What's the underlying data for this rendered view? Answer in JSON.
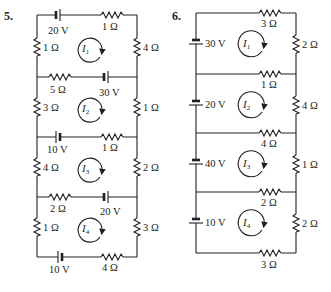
{
  "problems": [
    {
      "number": "5.",
      "loops": [
        {
          "current": "I",
          "sub": "1"
        },
        {
          "current": "I",
          "sub": "2"
        },
        {
          "current": "I",
          "sub": "3"
        },
        {
          "current": "I",
          "sub": "4"
        }
      ],
      "components": {
        "top_battery": "20 V",
        "top_resistor": "1 Ω",
        "loop1_left": "1 Ω",
        "loop1_right": "4 Ω",
        "h1_resistor": "5 Ω",
        "h1_battery": "30 V",
        "loop2_left": "3 Ω",
        "loop2_right": "1 Ω",
        "h2_battery": "10 V",
        "h2_resistor": "1 Ω",
        "loop3_left": "4 Ω",
        "loop3_right": "2 Ω",
        "h3_resistor": "2 Ω",
        "h3_battery": "20 V",
        "loop4_left": "1 Ω",
        "loop4_right": "3 Ω",
        "bottom_battery": "10 V",
        "bottom_resistor": "4 Ω"
      }
    },
    {
      "number": "6.",
      "loops": [
        {
          "current": "I",
          "sub": "1"
        },
        {
          "current": "I",
          "sub": "2"
        },
        {
          "current": "I",
          "sub": "3"
        },
        {
          "current": "I",
          "sub": "4"
        }
      ],
      "components": {
        "top_resistor": "3 Ω",
        "loop1_battery": "30 V",
        "loop1_right": "2 Ω",
        "h1_resistor": "1 Ω",
        "loop2_battery": "20 V",
        "loop2_right": "4 Ω",
        "h2_resistor": "4 Ω",
        "loop3_battery": "40 V",
        "loop3_right": "1 Ω",
        "h3_resistor": "2 Ω",
        "loop4_battery": "10 V",
        "loop4_right": "2 Ω",
        "bottom_resistor": "3 Ω"
      }
    }
  ]
}
